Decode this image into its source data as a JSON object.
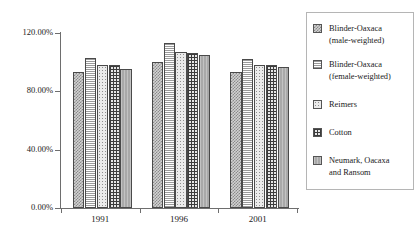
{
  "chart_data": {
    "type": "bar",
    "title": "",
    "xlabel": "",
    "ylabel": "",
    "categories": [
      "1991",
      "1996",
      "2001"
    ],
    "ylim": [
      0,
      120
    ],
    "ytick_labels": [
      "0.00%",
      "40.00%",
      "80.00%",
      "120.00%"
    ],
    "ytick_values": [
      0,
      40,
      80,
      120
    ],
    "grid": false,
    "legend_position": "right",
    "series": [
      {
        "name": "Blinder-Oaxaca\n(male-weighted)",
        "pattern": "checker",
        "values": [
          93,
          100,
          93
        ]
      },
      {
        "name": "Blinder-Oaxaca\n(female-weighted)",
        "pattern": "hlines",
        "values": [
          103,
          113,
          102
        ]
      },
      {
        "name": "Reimers",
        "pattern": "dots",
        "values": [
          98,
          107,
          98
        ]
      },
      {
        "name": "Cotton",
        "pattern": "grid",
        "values": [
          98,
          106,
          98
        ]
      },
      {
        "name": "Neumark, Oacaxa\nand Ransom",
        "pattern": "solid",
        "values": [
          95,
          105,
          97
        ]
      }
    ]
  },
  "axes": {
    "y_ticks": [
      {
        "label": "120.00%",
        "value": 120
      },
      {
        "label": "80.00%",
        "value": 80
      },
      {
        "label": "40.00%",
        "value": 40
      },
      {
        "label": "0.00%",
        "value": 0
      }
    ],
    "x_ticks": [
      {
        "label": "1991"
      },
      {
        "label": "1996"
      },
      {
        "label": "2001"
      }
    ]
  },
  "legend": {
    "entries": [
      {
        "label": "Blinder-Oaxaca\n(male-weighted)"
      },
      {
        "label": "Blinder-Oaxaca\n(female-weighted)"
      },
      {
        "label": "Reimers"
      },
      {
        "label": "Cotton"
      },
      {
        "label": "Neumark, Oacaxa\nand Ransom"
      }
    ]
  },
  "colors": {
    "axis": "#6e6e6e",
    "bar_outline": "#4a4a4a",
    "text": "#1a1a1a",
    "legend_border": "#b5b5b5",
    "background": "#ffffff"
  }
}
